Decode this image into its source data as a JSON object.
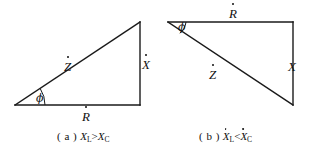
{
  "figure": {
    "stroke_color": "#1a1a1a",
    "background_color": "#ffffff",
    "panels": [
      {
        "id": "a",
        "caption_tag": "( a )",
        "caption_expr_left": "X",
        "caption_expr_left_sub": "L",
        "caption_operator": ">",
        "caption_expr_right": "X",
        "caption_expr_right_sub": "C",
        "caption_dotted": false,
        "labels": {
          "hypotenuse": "Z",
          "vertical": "X",
          "horizontal": "R",
          "angle": "ϕ"
        },
        "geometry": {
          "origin_x": 15,
          "origin_y": 105,
          "corner_x": 140,
          "corner_y": 105,
          "apex_x": 140,
          "apex_y": 22
        }
      },
      {
        "id": "b",
        "caption_tag": "( b )",
        "caption_expr_left": "X",
        "caption_expr_left_sub": "L",
        "caption_operator": "<",
        "caption_expr_right": "X",
        "caption_expr_right_sub": "C",
        "caption_dotted": true,
        "labels": {
          "hypotenuse": "Z",
          "vertical": "X",
          "horizontal": "R",
          "angle": "ϕ"
        },
        "geometry": {
          "origin_x": 168,
          "origin_y": 22,
          "corner_x": 293,
          "corner_y": 22,
          "apex_x": 293,
          "apex_y": 105
        }
      }
    ]
  }
}
